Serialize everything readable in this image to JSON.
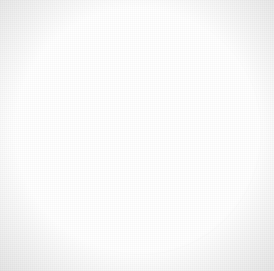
{
  "figure": {
    "caption": "",
    "canvas": {
      "width": 274,
      "height": 271
    },
    "background_color": "#ffffff",
    "medium": "scanned halftone line illustration"
  },
  "field": {
    "name": "circular field outline",
    "shape": "circle",
    "outline_color": "#2b2b2b",
    "outline_width_px": 1,
    "fill_color": "#ffffff",
    "bounds": {
      "left": 20,
      "top": 8,
      "width": 242,
      "height": 247
    }
  },
  "objects": [
    {
      "name": "upper diplo body",
      "description": "two overlapping dark spheres stacked vertically",
      "sphere_count": 2,
      "orientation": "vertical",
      "fill_color": "#343434",
      "highlight_color": "#8d8d8d",
      "bounds": {
        "left": 99,
        "top": 33,
        "width": 56,
        "height": 70
      },
      "highlight_position": "upper-left",
      "shadow": {
        "name": "upper cast shadow",
        "color": "#5a5a5a",
        "direction": "lower-left",
        "bounds": {
          "left": 56,
          "top": 58,
          "width": 86,
          "height": 74
        }
      }
    },
    {
      "name": "lower diplo body",
      "description": "two overlapping dark spheres paired side by side",
      "sphere_count": 2,
      "orientation": "horizontal",
      "fill_color": "#3a3a3a",
      "highlight_color": "#8a8a8a",
      "bounds": {
        "left": 148,
        "top": 170,
        "width": 64,
        "height": 52
      },
      "highlight_position": "upper-left",
      "shadow": {
        "name": "lower cast shadow",
        "color": "#5f5f5f",
        "direction": "upper-right",
        "bounds": {
          "left": 150,
          "top": 122,
          "width": 92,
          "height": 78
        }
      }
    }
  ],
  "colors": {
    "ink": "#2b2b2b",
    "paper": "#ffffff",
    "body_dark": "#1b1b1b",
    "body_mid": "#4d4d4d",
    "body_light": "#8d8d8d",
    "shadow": "#8a8a8a",
    "corner_tint": "#e9e9e9"
  }
}
